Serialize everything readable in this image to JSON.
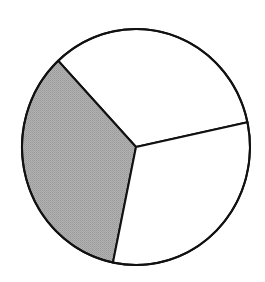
{
  "chart_data": {
    "type": "pie",
    "title": "",
    "legend": [],
    "start_angle_deg": 12.1,
    "direction": "counterclockwise",
    "slices": [
      {
        "label": "",
        "value": 33.6,
        "fill": "#ffffff",
        "position": "top"
      },
      {
        "label": "",
        "value": 34.8,
        "fill": "#aaaaaa",
        "position": "left"
      },
      {
        "label": "",
        "value": 31.6,
        "fill": "#ffffff",
        "position": "bottom-right"
      }
    ],
    "stroke": "#111111",
    "stroke_width": 2,
    "geometry": {
      "cx": 136,
      "cy": 147,
      "rx": 114,
      "ry": 118
    }
  }
}
